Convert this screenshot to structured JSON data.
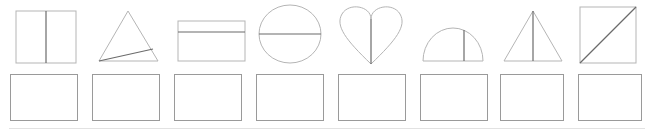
{
  "worksheet": {
    "title": "Lines of Symmetry Worksheet",
    "instruction": "",
    "shape_count": 8,
    "answer_box_count": 8
  },
  "colors": {
    "shape_outline": "#b5b5b5",
    "symmetry_line": "#6b6b6b",
    "answer_box_border": "#9a9a9a",
    "background": "#ffffff",
    "footer_rule": "#e2e2e2"
  },
  "shapes": [
    {
      "index": 1,
      "name": "square",
      "label": "Square",
      "line_name": "vertical-line",
      "line_description": "vertical line through centre",
      "is_line_of_symmetry": true
    },
    {
      "index": 2,
      "name": "triangle",
      "label": "Triangle",
      "line_name": "oblique-line",
      "line_description": "slanted line from bottom-left vertex to right side",
      "is_line_of_symmetry": false
    },
    {
      "index": 3,
      "name": "rectangle",
      "label": "Rectangle",
      "line_name": "horizontal-line",
      "line_description": "horizontal line above centre",
      "is_line_of_symmetry": false
    },
    {
      "index": 4,
      "name": "circle",
      "label": "Circle",
      "line_name": "horizontal-diameter",
      "line_description": "horizontal line through centre",
      "is_line_of_symmetry": true
    },
    {
      "index": 5,
      "name": "heart",
      "label": "Heart",
      "line_name": "vertical-line",
      "line_description": "vertical line through centre",
      "is_line_of_symmetry": true
    },
    {
      "index": 6,
      "name": "semicircle",
      "label": "Semicircle",
      "line_name": "vertical-line-offset",
      "line_description": "vertical line right of centre",
      "is_line_of_symmetry": false
    },
    {
      "index": 7,
      "name": "isosceles-triangle",
      "label": "Isosceles triangle",
      "line_name": "vertical-altitude",
      "line_description": "vertical line through apex and base centre",
      "is_line_of_symmetry": true
    },
    {
      "index": 8,
      "name": "square",
      "label": "Square",
      "line_name": "diagonal-line",
      "line_description": "diagonal from bottom-left to top-right corner",
      "is_line_of_symmetry": true
    }
  ],
  "answers": [
    {
      "index": 1,
      "value": "",
      "placeholder": ""
    },
    {
      "index": 2,
      "value": "",
      "placeholder": ""
    },
    {
      "index": 3,
      "value": "",
      "placeholder": ""
    },
    {
      "index": 4,
      "value": "",
      "placeholder": ""
    },
    {
      "index": 5,
      "value": "",
      "placeholder": ""
    },
    {
      "index": 6,
      "value": "",
      "placeholder": ""
    },
    {
      "index": 7,
      "value": "",
      "placeholder": ""
    },
    {
      "index": 8,
      "value": "",
      "placeholder": ""
    }
  ],
  "layout": {
    "shape_x": [
      12,
      94,
      176,
      253,
      332,
      415,
      497,
      577
    ],
    "answer_x": [
      10,
      92,
      174,
      256,
      338,
      420,
      500,
      578
    ],
    "answer_w": [
      68,
      68,
      68,
      68,
      68,
      68,
      64,
      64
    ]
  }
}
